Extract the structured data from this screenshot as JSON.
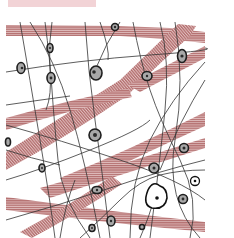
{
  "figure": {
    "caption_visible_fragment": "",
    "colors": {
      "background": "#ffffff",
      "caption_tint": "#f2d3d6",
      "collagen_band": "#b5706f",
      "collagen_stripe": "#f1dcdc",
      "fiber_line": "#333333",
      "cell_fill": "#a9a9a9",
      "cell_outline": "#1e1e1e",
      "nucleus": "#111111"
    },
    "elements": {
      "collagen_bundles": 7,
      "elastic_fibers": "many thin wavy lines",
      "fibroblast_cells": 20,
      "fat_cell": 1,
      "mast_or_round_cells": 2
    }
  }
}
